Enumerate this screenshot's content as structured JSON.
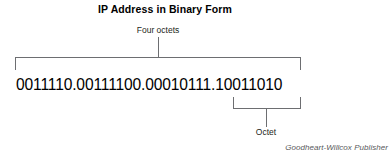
{
  "figure": {
    "title": "IP Address in Binary Form",
    "binary_address": "0011110.00111100.00010111.10011010",
    "credit": "Goodheart-Willcox Publisher",
    "colors": {
      "background": "#ffffff",
      "text": "#000000",
      "label_text": "#231f20",
      "rule": "#6d6e71",
      "credit_text": "#58595b"
    },
    "annotations": [
      {
        "id": "four-octets",
        "label": "Four octets",
        "points_to": "entire-binary-address",
        "bracket": "above"
      },
      {
        "id": "octet",
        "label": "Octet",
        "points_to": "last-octet",
        "bracket": "below"
      }
    ]
  }
}
